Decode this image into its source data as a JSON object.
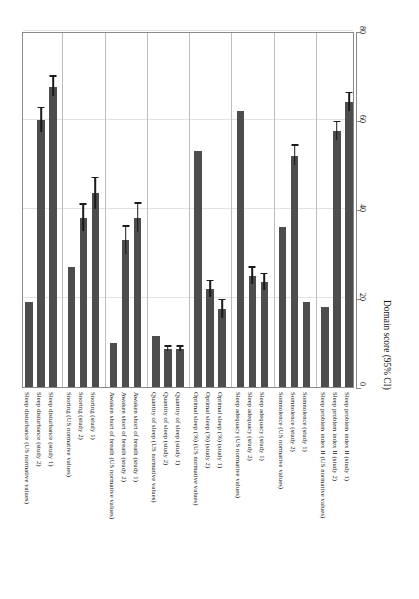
{
  "chart_data": {
    "type": "bar",
    "orientation": "vertical-bars-rotated",
    "title": "",
    "xlabel": "",
    "ylabel": "Domain score (95% CI)",
    "ylim": [
      0,
      80
    ],
    "yticks": [
      0,
      20,
      40,
      60,
      80
    ],
    "ytick_labels": [
      "0",
      "20",
      "40",
      "60",
      "80"
    ],
    "grid": true,
    "legend": "none",
    "bar_color": "#4d4d4d",
    "error_color": "#1b1b1b",
    "groups": [
      {
        "name": "Sleep disturbance",
        "bars": [
          {
            "label": "Sleep disturbance (US normative values)",
            "value": 19.0,
            "err_low": 0,
            "err_high": 0
          },
          {
            "label": "Sleep disturbance (study 2)",
            "value": 60.0,
            "err_low": 2.6,
            "err_high": 2.6
          },
          {
            "label": "Sleep disturbance (study 1)",
            "value": 67.5,
            "err_low": 2.2,
            "err_high": 2.2
          }
        ]
      },
      {
        "name": "Snoring",
        "bars": [
          {
            "label": "Snoring (US normative values)",
            "value": 27.0,
            "err_low": 0,
            "err_high": 0
          },
          {
            "label": "Snoring (study 2)",
            "value": 38.0,
            "err_low": 3.0,
            "err_high": 3.0
          },
          {
            "label": "Snoring (study 1)",
            "value": 43.5,
            "err_low": 3.4,
            "err_high": 3.4
          }
        ]
      },
      {
        "name": "Awaken short of breath",
        "bars": [
          {
            "label": "Awaken short of breath (US normative values)",
            "value": 10.0,
            "err_low": 0,
            "err_high": 0
          },
          {
            "label": "Awaken short of breath (study 2)",
            "value": 33.0,
            "err_low": 3.0,
            "err_high": 3.0
          },
          {
            "label": "Awaken short of breath (study 1)",
            "value": 38.0,
            "err_low": 3.2,
            "err_high": 3.2
          }
        ]
      },
      {
        "name": "Quantity of sleep",
        "bars": [
          {
            "label": "Quantity of sleep (US normative values)",
            "value": 11.5,
            "err_low": 0,
            "err_high": 0
          },
          {
            "label": "Quantity of sleep (study 2)",
            "value": 8.5,
            "err_low": 0.5,
            "err_high": 0.5
          },
          {
            "label": "Quantity of sleep (study 1)",
            "value": 8.5,
            "err_low": 0.5,
            "err_high": 0.5
          }
        ]
      },
      {
        "name": "Optimal sleep (%)",
        "bars": [
          {
            "label": "Optimal sleep (%) (US normative values)",
            "value": 53.0,
            "err_low": 0,
            "err_high": 0
          },
          {
            "label": "Optimal sleep (%) (study 2)",
            "value": 22.0,
            "err_low": 1.8,
            "err_high": 1.8
          },
          {
            "label": "Optimal sleep (%) (study 1)",
            "value": 17.5,
            "err_low": 2.0,
            "err_high": 2.0
          }
        ]
      },
      {
        "name": "Sleep adequacy",
        "bars": [
          {
            "label": "Sleep adequacy (US normative values)",
            "value": 62.0,
            "err_low": 0,
            "err_high": 0
          },
          {
            "label": "Sleep adequacy (study 2)",
            "value": 25.0,
            "err_low": 1.8,
            "err_high": 1.8
          },
          {
            "label": "Sleep adequacy (study 1)",
            "value": 23.5,
            "err_low": 1.8,
            "err_high": 1.8
          }
        ]
      },
      {
        "name": "Somnolence",
        "bars": [
          {
            "label": "Somnolence (US normative values)",
            "value": 36.0,
            "err_low": 0,
            "err_high": 0
          },
          {
            "label": "Somnolence (study 2)",
            "value": 52.0,
            "err_low": 2.2,
            "err_high": 2.2
          },
          {
            "label": "Somnolence (study 1)",
            "value": 19.0,
            "err_low": 0,
            "err_high": 0
          }
        ]
      },
      {
        "name": "Sleep problem index II",
        "bars": [
          {
            "label": "Sleep problem index II (US normative values)",
            "value": 18.0,
            "err_low": 0,
            "err_high": 0
          },
          {
            "label": "Sleep problem index II (study 2)",
            "value": 57.5,
            "err_low": 2.0,
            "err_high": 2.0
          },
          {
            "label": "Sleep problem index II (study 1)",
            "value": 64.0,
            "err_low": 2.0,
            "err_high": 2.0
          }
        ]
      }
    ]
  }
}
